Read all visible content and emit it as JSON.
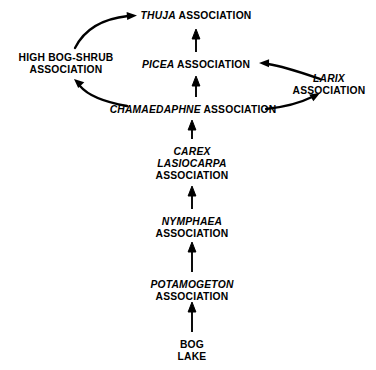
{
  "diagram": {
    "background_color": "#ffffff",
    "ink_color": "#000000",
    "nodes": [
      {
        "id": "thuja",
        "name": "thuja-association",
        "lines": [
          {
            "text": "THUJA",
            "style": "italic"
          },
          {
            "text": " ASSOCIATION",
            "style": "normal"
          }
        ],
        "single_line": true,
        "x": 196,
        "y": 10
      },
      {
        "id": "high_bog_shrub",
        "name": "high-bog-shrub-association",
        "lines": [
          {
            "text": "HIGH BOG-SHRUB",
            "style": "normal"
          },
          {
            "text": "ASSOCIATION",
            "style": "normal"
          }
        ],
        "single_line": false,
        "x": 66,
        "y": 52
      },
      {
        "id": "picea",
        "name": "picea-association",
        "lines": [
          {
            "text": "PICEA",
            "style": "italic"
          },
          {
            "text": " ASSOCIATION",
            "style": "normal"
          }
        ],
        "single_line": true,
        "x": 196,
        "y": 59
      },
      {
        "id": "larix",
        "name": "larix-association",
        "lines": [
          {
            "text": "LARIX",
            "style": "italic"
          },
          {
            "text": "ASSOCIATION",
            "style": "normal"
          }
        ],
        "single_line": false,
        "x": 329,
        "y": 73
      },
      {
        "id": "chamaedaphne",
        "name": "chamaedaphne-association",
        "lines": [
          {
            "text": "CHAMAEDAPHNE",
            "style": "italic"
          },
          {
            "text": " ASSOCIATION",
            "style": "normal"
          }
        ],
        "single_line": true,
        "x": 193,
        "y": 104
      },
      {
        "id": "carex",
        "name": "carex-lasiocarpa-association",
        "lines": [
          {
            "text": "CAREX",
            "style": "italic"
          },
          {
            "text": "LASIOCARPA",
            "style": "italic"
          },
          {
            "text": "ASSOCIATION",
            "style": "normal"
          }
        ],
        "single_line": false,
        "x": 192,
        "y": 146
      },
      {
        "id": "nymphaea",
        "name": "nymphaea-association",
        "lines": [
          {
            "text": "NYMPHAEA",
            "style": "italic"
          },
          {
            "text": "ASSOCIATION",
            "style": "normal"
          }
        ],
        "single_line": false,
        "x": 192,
        "y": 216
      },
      {
        "id": "potamogeton",
        "name": "potamogeton-association",
        "lines": [
          {
            "text": "POTAMOGETON",
            "style": "italic"
          },
          {
            "text": "ASSOCIATION",
            "style": "normal"
          }
        ],
        "single_line": false,
        "x": 192,
        "y": 279
      },
      {
        "id": "bog_lake",
        "name": "bog-lake",
        "lines": [
          {
            "text": "BOG",
            "style": "normal"
          },
          {
            "text": "LAKE",
            "style": "normal"
          }
        ],
        "single_line": false,
        "x": 192,
        "y": 339
      }
    ],
    "edges": [
      {
        "id": "e1",
        "name": "edge-bog-lake-to-potamogeton",
        "from": "bog_lake",
        "to": "potamogeton",
        "shape": "straight"
      },
      {
        "id": "e2",
        "name": "edge-potamogeton-to-nymphaea",
        "from": "potamogeton",
        "to": "nymphaea",
        "shape": "straight"
      },
      {
        "id": "e3",
        "name": "edge-nymphaea-to-carex",
        "from": "nymphaea",
        "to": "carex",
        "shape": "straight"
      },
      {
        "id": "e4",
        "name": "edge-carex-to-chamaedaphne",
        "from": "carex",
        "to": "chamaedaphne",
        "shape": "straight"
      },
      {
        "id": "e5",
        "name": "edge-chamaedaphne-to-picea",
        "from": "chamaedaphne",
        "to": "picea",
        "shape": "straight"
      },
      {
        "id": "e6",
        "name": "edge-picea-to-thuja",
        "from": "picea",
        "to": "thuja",
        "shape": "straight"
      },
      {
        "id": "e7",
        "name": "edge-chamaedaphne-to-high-bog-shrub",
        "from": "chamaedaphne",
        "to": "high_bog_shrub",
        "shape": "curved"
      },
      {
        "id": "e8",
        "name": "edge-high-bog-shrub-to-thuja",
        "from": "high_bog_shrub",
        "to": "thuja",
        "shape": "curved"
      },
      {
        "id": "e9",
        "name": "edge-chamaedaphne-to-larix",
        "from": "chamaedaphne",
        "to": "larix",
        "shape": "curved"
      },
      {
        "id": "e10",
        "name": "edge-larix-to-picea",
        "from": "larix",
        "to": "picea",
        "shape": "curved"
      }
    ]
  }
}
